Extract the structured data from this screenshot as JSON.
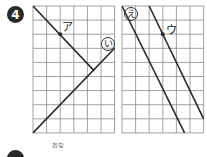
{
  "problem": {
    "number": "4",
    "next_label_fragment": "おな"
  },
  "diagrams": [
    {
      "name": "left-grid",
      "cols": 6,
      "rows": 9,
      "lines": [
        {
          "label": "ア",
          "circled": false,
          "from": [
            0,
            0
          ],
          "to": [
            4.5,
            4.6
          ],
          "point": [
            2,
            2
          ]
        },
        {
          "label": "い",
          "circled": true,
          "from": [
            0,
            9
          ],
          "to": [
            6,
            3
          ]
        }
      ]
    },
    {
      "name": "right-grid",
      "cols": 6,
      "rows": 9,
      "lines": [
        {
          "label": "え",
          "circled": true,
          "from": [
            0,
            0
          ],
          "to": [
            4.6,
            9
          ]
        },
        {
          "label": "ウ",
          "circled": false,
          "from": [
            2,
            0
          ],
          "to": [
            6,
            8
          ],
          "point": [
            3,
            2
          ]
        }
      ]
    }
  ],
  "colors": {
    "grid": "#8a8a8a",
    "line": "#2a2a2a",
    "badge": "#2a2a2a"
  }
}
